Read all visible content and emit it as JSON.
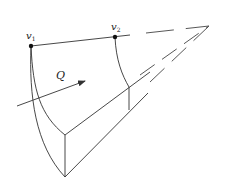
{
  "diagram": {
    "type": "stream-tube / control-volume sketch",
    "labels": {
      "v1": {
        "main": "v",
        "sub": "1"
      },
      "v2": {
        "main": "v",
        "sub": "2"
      },
      "flow": "Q"
    },
    "colors": {
      "line": "#333333",
      "background": "#ffffff"
    },
    "points": {
      "v1": [
        31,
        46
      ],
      "v2": [
        115,
        37
      ],
      "apex": [
        209,
        26
      ],
      "inner_bottom": [
        65,
        135
      ],
      "outer_bottom": [
        65,
        177
      ],
      "v2_edge_top": [
        129,
        87
      ],
      "v2_edge_bottom": [
        129,
        110
      ]
    }
  }
}
